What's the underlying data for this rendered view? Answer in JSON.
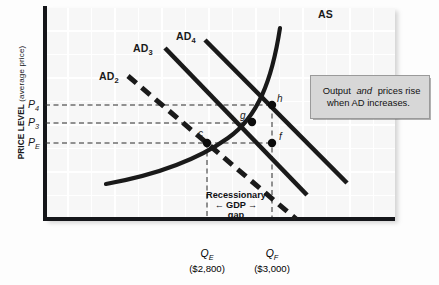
{
  "figure": {
    "y_axis_title_main": "PRICE LEVEL",
    "y_axis_title_sub": "(average price)"
  },
  "curves": [
    {
      "id": "as",
      "label": "AS",
      "style": "solid-curve",
      "label_x": 318,
      "label_y": 14
    },
    {
      "id": "ad4",
      "label": "AD",
      "sub": "4",
      "style": "solid",
      "label_x": 178,
      "label_y": 33
    },
    {
      "id": "ad3",
      "label": "AD",
      "sub": "3",
      "style": "solid",
      "label_x": 135,
      "label_y": 44
    },
    {
      "id": "ad2",
      "label": "AD",
      "sub": "2",
      "style": "dashed",
      "label_x": 100,
      "label_y": 73
    }
  ],
  "price_ticks": [
    {
      "id": "p4",
      "label": "P",
      "sub": "4",
      "y": 105
    },
    {
      "id": "p3",
      "label": "P",
      "sub": "3",
      "y": 123
    },
    {
      "id": "pe",
      "label": "P",
      "sub": "E",
      "y": 143
    }
  ],
  "quantity_ticks": [
    {
      "id": "qe",
      "label": "Q",
      "sub": "E",
      "amount": "($2,800)",
      "x": 207
    },
    {
      "id": "qf",
      "label": "Q",
      "sub": "F",
      "amount": "($3,000)",
      "x": 272
    }
  ],
  "points": [
    {
      "id": "c",
      "label": "c",
      "x": 207,
      "y": 143,
      "label_x": 199,
      "label_y": 133
    },
    {
      "id": "g",
      "label": "g",
      "x": 252,
      "y": 122,
      "label_x": 241,
      "label_y": 115
    },
    {
      "id": "h",
      "label": "h",
      "x": 272,
      "y": 105,
      "label_x": 277,
      "label_y": 98
    },
    {
      "id": "f",
      "label": "f",
      "x": 272,
      "y": 143,
      "label_x": 279,
      "label_y": 136
    }
  ],
  "gap_annotation": {
    "line1": "Recessionary",
    "arrow_left": "←",
    "line2": "GDP",
    "arrow_right": "→",
    "line3": "gap"
  },
  "callout": {
    "text_before": "Output ",
    "text_italic": "and",
    "text_after": " prices rise when AD increases."
  },
  "colors": {
    "curve": "#1a1a1a",
    "axis": "#15161a",
    "plot_background": "#f7f7f7",
    "grid": "#ffffff",
    "callout_background": "#d7d7d7",
    "callout_border": "#9a9a9a"
  }
}
